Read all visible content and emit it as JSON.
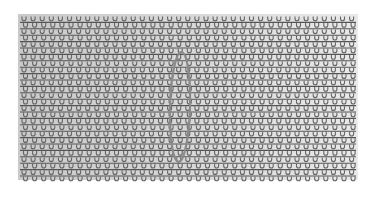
{
  "image": {
    "description": "Grayscale texture of horizontal rows of small looped stitches (U-shaped loops hanging from horizontal lines) with a vertical elliptical outline drawn near the center",
    "pattern": {
      "left": 18,
      "top": 14,
      "right": 358,
      "bottom": 180,
      "row_count": 26,
      "row_pitch": 6.4,
      "loop_pitch": 9.1,
      "line_color": "#555555",
      "loop_color": "#666666",
      "bg_left_color": "#c9c9c9",
      "bg_right_color": "#e9e9e9"
    },
    "ellipse": {
      "cx": 180,
      "cy": 107,
      "rx": 10,
      "ry": 55,
      "stroke_color": "#8a8a8a",
      "stroke_width": 2.2
    }
  }
}
